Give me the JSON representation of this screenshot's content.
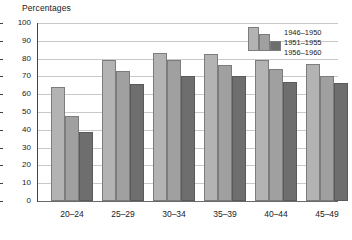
{
  "chart_data": {
    "type": "bar",
    "title": "Percentages",
    "xlabel": "",
    "ylabel": "",
    "ylim": [
      0,
      100
    ],
    "yticks": [
      0,
      10,
      20,
      30,
      40,
      50,
      60,
      70,
      80,
      90,
      100
    ],
    "grid": true,
    "legend_position": "top-right",
    "categories": [
      "20–24",
      "25–29",
      "30–34",
      "35–39",
      "40–44",
      "45–49"
    ],
    "series": [
      {
        "name": "1946–1950",
        "color": "#b3b3b3",
        "values": [
          64,
          79.5,
          83,
          82.5,
          79,
          77
        ]
      },
      {
        "name": "1951–1955",
        "color": "#a0a0a0",
        "values": [
          48,
          73,
          79,
          76.5,
          74,
          70.5
        ]
      },
      {
        "name": "1956–1960",
        "color": "#6e6e6e",
        "values": [
          38.5,
          65.5,
          70.5,
          70.5,
          67,
          66.5
        ]
      }
    ]
  }
}
